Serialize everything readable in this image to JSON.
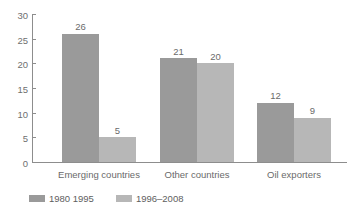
{
  "chart_data": {
    "type": "bar",
    "title": "",
    "subtitle": "",
    "xlabel": "",
    "ylabel": "",
    "ylim": [
      0,
      30
    ],
    "yticks": [
      0,
      5,
      10,
      15,
      20,
      25,
      30
    ],
    "ytick_labels": [
      "0",
      "5",
      "10",
      "15",
      "20",
      "25",
      "30"
    ],
    "grid": false,
    "legend_position": "bottom-left",
    "categories": [
      "Emerging countries",
      "Other countries",
      "Oil exporters"
    ],
    "series": [
      {
        "name": "1980 1995",
        "color": "#9a9a9a",
        "values": [
          26,
          21,
          12
        ],
        "value_labels": [
          "26",
          "21",
          "12"
        ]
      },
      {
        "name": "1996–2008",
        "color": "#b7b7b7",
        "values": [
          5,
          20,
          9
        ],
        "value_labels": [
          "5",
          "20",
          "9"
        ]
      }
    ]
  },
  "axis": {
    "line_color": "#8d8d8d",
    "tick_color": "#8d8d8d",
    "label_color": "#6f6f6f"
  },
  "legend": {
    "items": [
      {
        "label": "1980  1995",
        "color": "#9a9a9a"
      },
      {
        "label": "1996–2008",
        "color": "#b7b7b7"
      }
    ]
  }
}
